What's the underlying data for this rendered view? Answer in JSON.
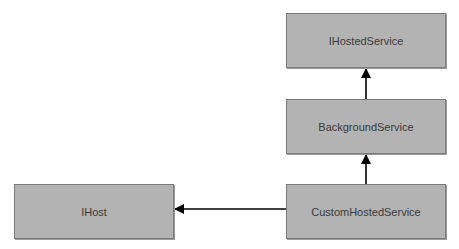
{
  "diagram": {
    "type": "inheritance-diagram",
    "nodes": [
      {
        "id": "ihostedservice",
        "label": "IHostedService"
      },
      {
        "id": "backgroundservice",
        "label": "BackgroundService"
      },
      {
        "id": "ihost",
        "label": "IHost"
      },
      {
        "id": "customhostedservice",
        "label": "CustomHostedService"
      }
    ],
    "edges": [
      {
        "from": "backgroundservice",
        "to": "ihostedservice"
      },
      {
        "from": "customhostedservice",
        "to": "backgroundservice"
      },
      {
        "from": "customhostedservice",
        "to": "ihost"
      }
    ],
    "colors": {
      "box_fill": "#b3b3b3",
      "box_border": "#7a7a7a",
      "text": "#3a3a3a",
      "arrow": "#000000"
    }
  }
}
